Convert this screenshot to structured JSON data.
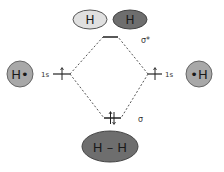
{
  "diagram": {
    "type": "molecular-orbital-diagram",
    "antibonding": {
      "label": "σ*",
      "atoms": [
        {
          "text": "H",
          "fill": "#e0e0e0"
        },
        {
          "text": "H",
          "fill": "#6e6e6e"
        }
      ]
    },
    "left_atom": {
      "text": "H•",
      "orbital": "1s",
      "fill": "#a8a8a8"
    },
    "right_atom": {
      "text": "•H",
      "orbital": "1s",
      "fill": "#a8a8a8"
    },
    "bonding": {
      "label": "σ",
      "molecule": {
        "text": "H – H",
        "fill": "#6e6e6e"
      }
    },
    "colors": {
      "line": "#222222",
      "dashed": "#555555"
    }
  }
}
